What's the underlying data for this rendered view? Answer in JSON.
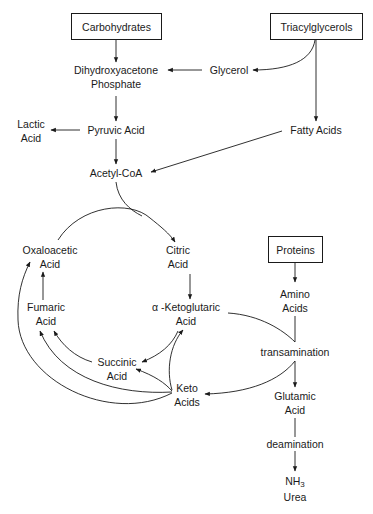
{
  "diagram": {
    "type": "metabolic-pathway",
    "sources": {
      "carbohydrates": "Carbohydrates",
      "triacylglycerols": "Triacylglycerols",
      "proteins": "Proteins"
    },
    "nodes": {
      "dhap_line1": "Dihydroxyacetone",
      "dhap_line2": "Phosphate",
      "glycerol": "Glycerol",
      "lactic_line1": "Lactic",
      "lactic_line2": "Acid",
      "pyruvic": "Pyruvic Acid",
      "fatty_acids": "Fatty Acids",
      "acetyl_coa": "Acetyl-CoA",
      "oxaloacetic_line1": "Oxaloacetic",
      "oxaloacetic_line2": "Acid",
      "citric_line1": "Citric",
      "citric_line2": "Acid",
      "fumaric_line1": "Fumaric",
      "fumaric_line2": "Acid",
      "ketoglutaric_line1": "α -Ketoglutaric",
      "ketoglutaric_line2": "Acid",
      "succinic_line1": "Succinic",
      "succinic_line2": "Acid",
      "keto_line1": "Keto",
      "keto_line2": "Acids",
      "amino_line1": "Amino",
      "amino_line2": "Acids",
      "transamination": "transamination",
      "glutamic_line1": "Glutamic",
      "glutamic_line2": "Acid",
      "deamination": "deamination",
      "nh3_base": "NH",
      "nh3_sub": "3",
      "urea": "Urea"
    },
    "edges": [
      {
        "from": "Carbohydrates",
        "to": "Dihydroxyacetone Phosphate"
      },
      {
        "from": "Triacylglycerols",
        "to": "Glycerol"
      },
      {
        "from": "Triacylglycerols",
        "to": "Fatty Acids"
      },
      {
        "from": "Glycerol",
        "to": "Dihydroxyacetone Phosphate"
      },
      {
        "from": "Dihydroxyacetone Phosphate",
        "to": "Pyruvic Acid"
      },
      {
        "from": "Pyruvic Acid",
        "to": "Lactic Acid"
      },
      {
        "from": "Pyruvic Acid",
        "to": "Acetyl-CoA"
      },
      {
        "from": "Fatty Acids",
        "to": "Acetyl-CoA"
      },
      {
        "from": "Acetyl-CoA",
        "to": "Citric Acid"
      },
      {
        "from": "Oxaloacetic Acid",
        "to": "Citric Acid"
      },
      {
        "from": "Citric Acid",
        "to": "α-Ketoglutaric Acid"
      },
      {
        "from": "α-Ketoglutaric Acid",
        "to": "Succinic Acid"
      },
      {
        "from": "Succinic Acid",
        "to": "Fumaric Acid"
      },
      {
        "from": "Fumaric Acid",
        "to": "Oxaloacetic Acid"
      },
      {
        "from": "Keto Acids",
        "to": "Succinic Acid"
      },
      {
        "from": "Keto Acids",
        "to": "Fumaric Acid"
      },
      {
        "from": "Keto Acids",
        "to": "Oxaloacetic Acid"
      },
      {
        "from": "Keto Acids",
        "to": "α-Ketoglutaric Acid"
      },
      {
        "from": "Proteins",
        "to": "Amino Acids"
      },
      {
        "from": "Amino Acids",
        "to": "transamination"
      },
      {
        "from": "α-Ketoglutaric Acid",
        "to": "transamination"
      },
      {
        "from": "transamination",
        "to": "Glutamic Acid"
      },
      {
        "from": "transamination",
        "to": "Keto Acids"
      },
      {
        "from": "Glutamic Acid",
        "to": "deamination"
      },
      {
        "from": "deamination",
        "to": "NH3 / Urea"
      }
    ]
  }
}
